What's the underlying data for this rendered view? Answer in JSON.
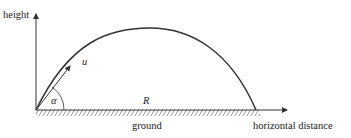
{
  "diagram": {
    "labels": {
      "y_axis": "height",
      "x_axis": "horizontal distance",
      "ground": "ground",
      "velocity": "u",
      "angle": "α",
      "range": "R"
    },
    "colors": {
      "line": "#333333",
      "text": "#222222",
      "background": "#ffffff"
    }
  }
}
